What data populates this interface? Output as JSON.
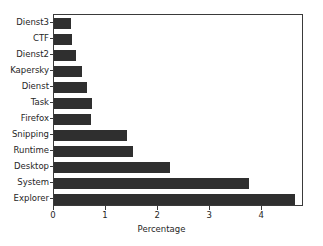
{
  "chart_data": {
    "type": "bar",
    "orientation": "horizontal",
    "title": "",
    "xlabel": "Percentage",
    "ylabel": "",
    "xlim": [
      0,
      4.8
    ],
    "xticks": [
      0,
      1,
      2,
      3,
      4
    ],
    "xtick_labels": [
      "0",
      "1",
      "2",
      "3",
      "4"
    ],
    "grid": false,
    "legend": null,
    "bar_color": "#2f2f2f",
    "categories": [
      "Dienst3",
      "CTF",
      "Dienst2",
      "Kapersky",
      "Dienst",
      "Task",
      "Firefox",
      "Snipping",
      "Runtime",
      "Desktop",
      "System",
      "Explorer"
    ],
    "values": [
      0.33,
      0.34,
      0.43,
      0.53,
      0.63,
      0.72,
      0.71,
      1.41,
      1.51,
      2.22,
      3.75,
      4.62
    ]
  },
  "axes": {
    "x_label": "Percentage"
  }
}
